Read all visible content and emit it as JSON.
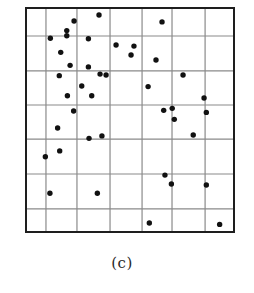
{
  "figure": {
    "caption": "(c)"
  },
  "colors": {
    "frame": "#1e1e1e",
    "grid": "#8a8a8a",
    "point": "#111111",
    "background": "#ffffff"
  },
  "chart_data": {
    "type": "scatter",
    "title": "",
    "caption": "(c)",
    "xlabel": "",
    "ylabel": "",
    "xlim": [
      0,
      100
    ],
    "ylim": [
      0,
      100
    ],
    "grid": true,
    "axis_ticks": false,
    "legend": null,
    "grid_lines": {
      "x": [
        9.6,
        24.5,
        40.4,
        55.8,
        70.2,
        86.1
      ],
      "y": [
        10.3,
        25.9,
        41.5,
        56.7,
        71.9,
        87.5
      ]
    },
    "series": [
      {
        "name": "points",
        "marker": "filled-circle",
        "points": [
          {
            "x": 35.1,
            "y": 96.9
          },
          {
            "x": 23.1,
            "y": 94.2
          },
          {
            "x": 19.6,
            "y": 89.9
          },
          {
            "x": 19.6,
            "y": 87.6
          },
          {
            "x": 11.7,
            "y": 86.5
          },
          {
            "x": 30.0,
            "y": 86.3
          },
          {
            "x": 16.7,
            "y": 80.2
          },
          {
            "x": 21.2,
            "y": 74.4
          },
          {
            "x": 30.0,
            "y": 73.7
          },
          {
            "x": 65.4,
            "y": 93.8
          },
          {
            "x": 43.3,
            "y": 83.5
          },
          {
            "x": 51.9,
            "y": 83.0
          },
          {
            "x": 50.5,
            "y": 79.0
          },
          {
            "x": 62.5,
            "y": 76.8
          },
          {
            "x": 35.6,
            "y": 70.5
          },
          {
            "x": 38.5,
            "y": 70.1
          },
          {
            "x": 75.5,
            "y": 70.1
          },
          {
            "x": 16.0,
            "y": 69.8
          },
          {
            "x": 26.8,
            "y": 65.2
          },
          {
            "x": 19.9,
            "y": 60.8
          },
          {
            "x": 31.6,
            "y": 60.8
          },
          {
            "x": 22.9,
            "y": 54.0
          },
          {
            "x": 15.2,
            "y": 46.4
          },
          {
            "x": 30.3,
            "y": 41.8
          },
          {
            "x": 36.5,
            "y": 42.9
          },
          {
            "x": 58.7,
            "y": 64.9
          },
          {
            "x": 85.6,
            "y": 59.8
          },
          {
            "x": 66.2,
            "y": 54.3
          },
          {
            "x": 70.3,
            "y": 55.2
          },
          {
            "x": 86.7,
            "y": 53.4
          },
          {
            "x": 71.3,
            "y": 50.3
          },
          {
            "x": 80.4,
            "y": 43.3
          },
          {
            "x": 16.2,
            "y": 36.2
          },
          {
            "x": 9.3,
            "y": 33.6
          },
          {
            "x": 11.5,
            "y": 17.3
          },
          {
            "x": 34.3,
            "y": 17.3
          },
          {
            "x": 66.8,
            "y": 25.4
          },
          {
            "x": 69.9,
            "y": 21.4
          },
          {
            "x": 86.7,
            "y": 21.0
          },
          {
            "x": 59.3,
            "y": 4.0
          },
          {
            "x": 93.1,
            "y": 3.4
          }
        ]
      }
    ]
  }
}
